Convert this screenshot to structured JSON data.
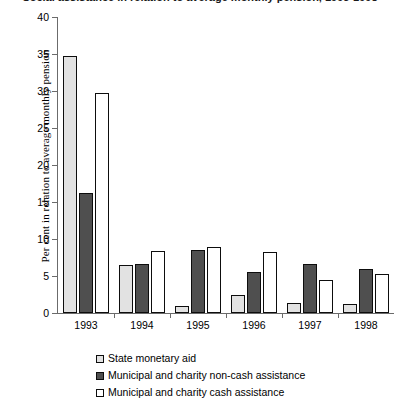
{
  "chart_data": {
    "type": "bar",
    "title": "Social assistance in relation to average monthly pension, 1993-1998",
    "xlabel": "",
    "ylabel": "Per cent in relation to average monthly pension",
    "categories": [
      "1993",
      "1994",
      "1995",
      "1996",
      "1997",
      "1998"
    ],
    "ylim": [
      0,
      40
    ],
    "yticks": [
      0,
      5,
      10,
      15,
      20,
      25,
      30,
      35,
      40
    ],
    "grid": false,
    "legend_position": "bottom",
    "series": [
      {
        "name": "State monetary aid",
        "color": "#e2e2e2",
        "values": [
          34.7,
          6.5,
          1.0,
          2.4,
          1.3,
          1.2
        ]
      },
      {
        "name": "Municipal and charity non-cash assistance",
        "color": "#4f4f4f",
        "values": [
          16.2,
          6.6,
          8.5,
          5.5,
          6.6,
          6.0
        ]
      },
      {
        "name": "Municipal and charity cash assistance",
        "color": "#ffffff",
        "values": [
          29.7,
          8.4,
          8.9,
          8.3,
          4.5,
          5.3
        ]
      }
    ]
  }
}
